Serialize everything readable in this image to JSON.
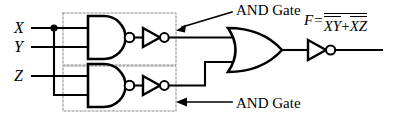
{
  "diagram": {
    "type": "logic-circuit",
    "stroke_color": "#000000",
    "background_color": "#ffffff",
    "dotted_box_color": "#999999"
  },
  "inputs": [
    {
      "id": "x",
      "label": "X",
      "y": 28,
      "has_junction_dot": true
    },
    {
      "id": "y",
      "label": "Y",
      "y": 47,
      "has_junction_dot": false
    },
    {
      "id": "z",
      "label": "Z",
      "y": 76,
      "has_junction_dot": false
    }
  ],
  "annotations": [
    {
      "id": "top",
      "text": "AND Gate",
      "points_to": "upper-and-gate-box"
    },
    {
      "id": "bottom",
      "text": "AND Gate",
      "points_to": "lower-and-gate-box"
    }
  ],
  "gates": [
    {
      "id": "nand-upper",
      "type": "NAND",
      "inputs": [
        "X",
        "Y"
      ]
    },
    {
      "id": "inverter-upper",
      "type": "NOT",
      "inputs": [
        "nand-upper"
      ]
    },
    {
      "id": "nand-lower",
      "type": "NAND",
      "inputs": [
        "Z",
        "X"
      ]
    },
    {
      "id": "inverter-lower",
      "type": "NOT",
      "inputs": [
        "nand-lower"
      ]
    },
    {
      "id": "or-gate",
      "type": "OR",
      "inputs": [
        "inverter-upper",
        "inverter-lower"
      ]
    },
    {
      "id": "inverter-output",
      "type": "NOT",
      "inputs": [
        "or-gate"
      ]
    }
  ],
  "output": {
    "name": "F",
    "equals": "=",
    "term1_vars": "XY",
    "operator": "+",
    "term2_vars": "XZ",
    "expression_plain": "F = NOT( NOT(XY) + NOT(XZ) )"
  }
}
